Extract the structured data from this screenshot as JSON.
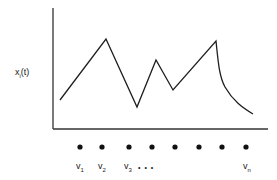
{
  "diagram": {
    "y_axis_label": {
      "base": "x",
      "subscript": "i",
      "suffix": "(t)"
    },
    "trace_shape": [
      "rise",
      "peak",
      "fall",
      "trough",
      "rise",
      "peak",
      "fall",
      "trough",
      "rise",
      "peak",
      "decay"
    ],
    "vertices": {
      "count_shown": 8,
      "labels": [
        {
          "base": "v",
          "sub": "1"
        },
        {
          "base": "v",
          "sub": "2"
        },
        {
          "base": "v",
          "sub": "3"
        },
        {
          "base": "v",
          "sub": "n"
        }
      ],
      "ellipsis": "• • •"
    }
  }
}
